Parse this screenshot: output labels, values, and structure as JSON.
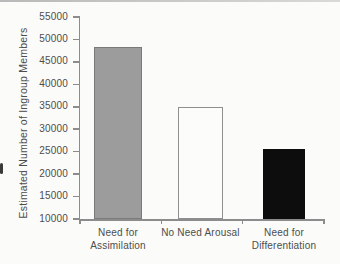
{
  "chart_data": {
    "type": "bar",
    "ylabel": "Estimated Number of Ingroup Members",
    "categories": [
      "Need for Assimilation",
      "No Need Arousal",
      "Need for Differentiation"
    ],
    "category_label_lines": [
      [
        "Need for",
        "Assimilation"
      ],
      [
        "No Need Arousal"
      ],
      [
        "Need for",
        "Differentiation"
      ]
    ],
    "values": [
      48400,
      34900,
      25500
    ],
    "ylim": [
      10000,
      55000
    ],
    "ytick_interval": 5000,
    "yticks": [
      10000,
      15000,
      20000,
      25000,
      30000,
      35000,
      40000,
      45000,
      50000,
      55000
    ],
    "grid": false,
    "bar_styles": [
      {
        "name": "gray",
        "fill": "#9c9c9c",
        "border": "#7a7a7a"
      },
      {
        "name": "white",
        "fill": "#fcfcfb",
        "border": "#8f8f8f"
      },
      {
        "name": "black",
        "fill": "#0d0d0d",
        "border": "#0d0d0d"
      }
    ],
    "axis_color": "#8c8c8c",
    "text_color": "#4d4d4d"
  }
}
